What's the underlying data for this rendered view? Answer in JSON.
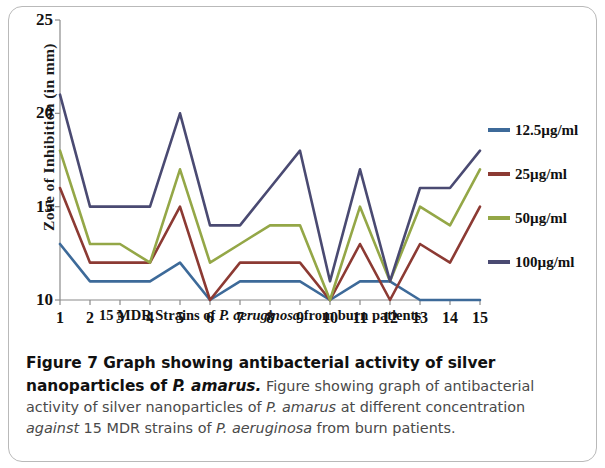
{
  "figure": {
    "caption_bold": "Figure 7 Graph showing antibacterial activity of silver nanoparticles of ",
    "caption_bold_italic": "P. amarus.",
    "caption_rest_1": " Figure showing graph of antibacterial activity of silver nanoparticles of ",
    "caption_italic_1": "P. amarus",
    "caption_rest_2": " at different concentration ",
    "caption_italic_2": "against",
    "caption_rest_3": " 15 MDR strains of ",
    "caption_italic_3": "P. aeruginosa",
    "caption_rest_4": " from burn patients."
  },
  "xaxis_title": {
    "part1": "15 MDR Strains of ",
    "italic": "P. aeruginosa",
    "part2": " from burn patients"
  },
  "chart_data": {
    "type": "line",
    "title": "",
    "xlabel": "15 MDR Strains of P. aeruginosa from burn patients",
    "ylabel": "Zone of Inhibition (in mm)",
    "categories": [
      "1",
      "2",
      "3",
      "4",
      "5",
      "6",
      "7",
      "8",
      "9",
      "10",
      "11",
      "12",
      "13",
      "14",
      "15"
    ],
    "x_tick_labels": [
      "1",
      "2",
      "3",
      "4",
      "5",
      "6",
      "7",
      "8",
      "9",
      "10",
      "11",
      "12",
      "13",
      "14",
      "15"
    ],
    "y_tick_labels": [
      "10",
      "15",
      "20",
      "25"
    ],
    "y_ticks": [
      10,
      15,
      20,
      25
    ],
    "ylim": [
      10,
      25
    ],
    "xlim": [
      1,
      15
    ],
    "grid": false,
    "legend_position": "right",
    "series": [
      {
        "name": "12.5µg/ml",
        "color": "#3d6a99",
        "values": [
          13,
          11,
          11,
          11,
          12,
          10,
          11,
          11,
          11,
          10,
          11,
          11,
          10,
          10,
          10
        ]
      },
      {
        "name": "25µg/ml",
        "color": "#8c3a33",
        "values": [
          16,
          12,
          12,
          12,
          15,
          10,
          12,
          12,
          12,
          10,
          13,
          10,
          13,
          12,
          15
        ]
      },
      {
        "name": "50µg/ml",
        "color": "#94a747",
        "values": [
          18,
          13,
          13,
          12,
          17,
          12,
          13,
          14,
          14,
          10,
          15,
          11,
          15,
          14,
          17
        ]
      },
      {
        "name": "100µg/ml",
        "color": "#4a4a72",
        "values": [
          21,
          15,
          15,
          15,
          20,
          14,
          14,
          16,
          18,
          11,
          17,
          11,
          16,
          16,
          18
        ]
      }
    ]
  }
}
